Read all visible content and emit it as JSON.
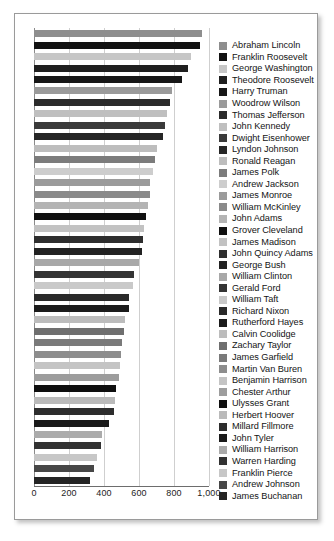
{
  "chart_data": {
    "type": "bar",
    "orientation": "horizontal",
    "title": "",
    "xlabel": "",
    "ylabel": "",
    "xlim": [
      0,
      1000
    ],
    "grid": true,
    "legend_position": "right",
    "xticks": [
      {
        "value": 0,
        "label": "0"
      },
      {
        "value": 200,
        "label": "200"
      },
      {
        "value": 400,
        "label": "400"
      },
      {
        "value": 600,
        "label": "600"
      },
      {
        "value": 800,
        "label": "800"
      },
      {
        "value": 1000,
        "label": "1,000"
      }
    ],
    "categories": [
      "Abraham Lincoln",
      "Franklin Roosevelt",
      "George Washington",
      "Theodore Roosevelt",
      "Harry Truman",
      "Woodrow Wilson",
      "Thomas Jefferson",
      "John Kennedy",
      "Dwight Eisenhower",
      "Lyndon Johnson",
      "Ronald Reagan",
      "James Polk",
      "Andrew Jackson",
      "James Monroe",
      "William McKinley",
      "John Adams",
      "Grover Cleveland",
      "James Madison",
      "John Quincy Adams",
      "George Bush",
      "William Clinton",
      "Gerald Ford",
      "William Taft",
      "Richard Nixon",
      "Rutherford Hayes",
      "Calvin Coolidge",
      "Zachary Taylor",
      "James Garfield",
      "Martin Van Buren",
      "Benjamin Harrison",
      "Chester Arthur",
      "Ulysses Grant",
      "Herbert Hoover",
      "Millard Fillmore",
      "John Tyler",
      "William Harrison",
      "Warren Harding",
      "Franklin Pierce",
      "Andrew Johnson",
      "James Buchanan"
    ],
    "values": [
      962,
      950,
      895,
      880,
      845,
      790,
      775,
      760,
      748,
      735,
      700,
      690,
      680,
      665,
      660,
      650,
      640,
      630,
      620,
      615,
      600,
      570,
      565,
      545,
      540,
      520,
      515,
      505,
      495,
      490,
      485,
      470,
      465,
      455,
      430,
      390,
      385,
      360,
      345,
      320
    ],
    "colors": [
      "#8e8e8e",
      "#111111",
      "#c6c6c6",
      "#1f1f1f",
      "#171717",
      "#9a9a9a",
      "#2b2b2b",
      "#bfbfbf",
      "#3a3a3a",
      "#262626",
      "#bdbdbd",
      "#7c7c7c",
      "#cdcdcd",
      "#9b9b9b",
      "#8a8a8a",
      "#b4b4b4",
      "#101010",
      "#c2c2c2",
      "#2e2e2e",
      "#222222",
      "#a8a8a8",
      "#343434",
      "#c9c9c9",
      "#2a2a2a",
      "#1b1b1b",
      "#bcbcbc",
      "#6f6f6f",
      "#7a7a7a",
      "#8d8d8d",
      "#c4c4c4",
      "#9d9d9d",
      "#0f0f0f",
      "#bababa",
      "#2d2d2d",
      "#1a1a1a",
      "#ababab",
      "#323232",
      "#c7c7c7",
      "#474747",
      "#242424"
    ]
  }
}
